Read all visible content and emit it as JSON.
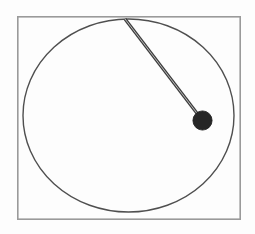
{
  "scene": {
    "name": "pendulum-on-circular-track",
    "width": 255,
    "height": 234,
    "background_color": "#fdfdfd",
    "title": ""
  },
  "frame": {
    "name": "border-rectangle",
    "x": 17,
    "y": 16,
    "width": 224,
    "height": 204,
    "stroke_color": "#9a9a9a",
    "stroke_width": 1.6,
    "fill": "none"
  },
  "track": {
    "name": "circle-outline",
    "center_x": 128.5,
    "center_y": 115.5,
    "radius_x": 105.5,
    "radius_y": 96.5,
    "stroke_color": "#4f4f4f",
    "stroke_width": 1.4,
    "fill": "none"
  },
  "rod": {
    "name": "pendulum-rod",
    "pivot_x": 125,
    "pivot_y": 19,
    "end_x": 202.5,
    "end_y": 120.5,
    "stroke_color": "#3f3f3f",
    "highlight_color": "#b8b8b8",
    "stroke_width": 2.6,
    "length": 127.8,
    "angle_deg": 37.4
  },
  "bob": {
    "name": "pendulum-bob",
    "center_x": 202.5,
    "center_y": 120.5,
    "radius": 9.6,
    "fill_color": "#262626",
    "stroke_color": "#1a1a1a"
  },
  "labels": {
    "caption": "",
    "units": ""
  }
}
